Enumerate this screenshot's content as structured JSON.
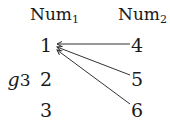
{
  "diagram": {
    "function_name": "g",
    "function_subscript": "3",
    "domain": {
      "name": "Num",
      "subscript": "2",
      "elements": [
        "4",
        "5",
        "6"
      ]
    },
    "codomain": {
      "name": "Num",
      "subscript": "1",
      "elements": [
        "1",
        "2",
        "3"
      ]
    },
    "mappings": [
      {
        "from": "4",
        "to": "1"
      },
      {
        "from": "5",
        "to": "1"
      },
      {
        "from": "6",
        "to": "1"
      }
    ],
    "colors": {
      "text": "#1a1a1a",
      "arrow": "#333333",
      "background": "#ffffff"
    }
  }
}
